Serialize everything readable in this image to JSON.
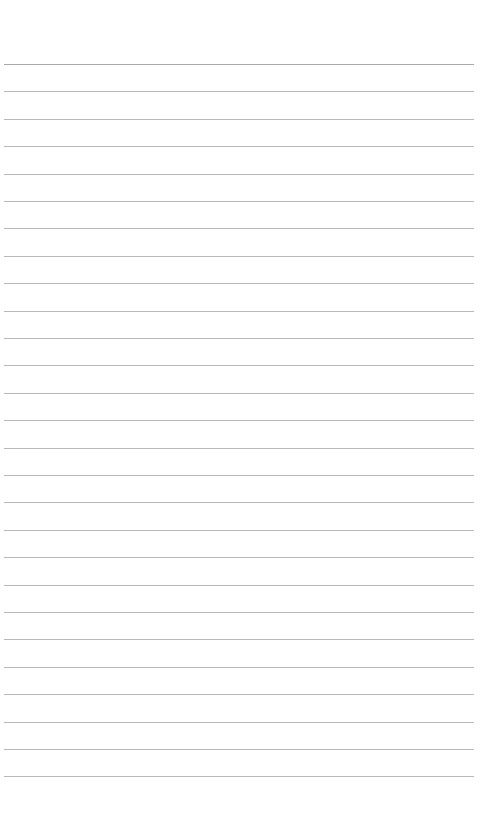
{
  "page": {
    "type": "lined-paper",
    "background_color": "#ffffff",
    "line_color": "#b8b8b8",
    "line_count": 27,
    "first_line_y": 64,
    "line_spacing": 27.4,
    "content": ""
  }
}
